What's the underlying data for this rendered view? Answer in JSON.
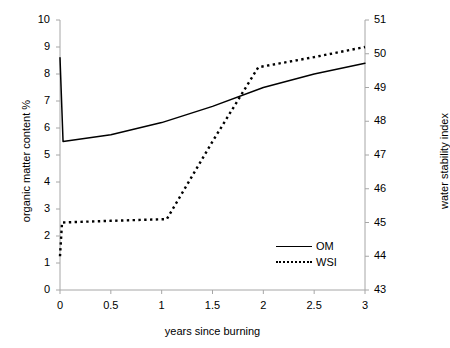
{
  "chart_data": {
    "type": "line",
    "title": "",
    "xlabel": "years since burning",
    "ylabel": "organic matter content  %",
    "y2label": "water stability index",
    "xlim": [
      0,
      3
    ],
    "ylim": [
      0,
      10
    ],
    "y2lim": [
      43,
      51
    ],
    "grid": false,
    "legend_position": "inside-bottom-right",
    "xticks": [
      "0",
      "0.5",
      "1",
      "1.5",
      "2",
      "2.5",
      "3"
    ],
    "xtick_values": [
      0,
      0.5,
      1,
      1.5,
      2,
      2.5,
      3
    ],
    "yticks": [
      "0",
      "1",
      "2",
      "3",
      "4",
      "5",
      "6",
      "7",
      "8",
      "9",
      "10"
    ],
    "ytick_values": [
      0,
      1,
      2,
      3,
      4,
      5,
      6,
      7,
      8,
      9,
      10
    ],
    "y2ticks": [
      "43",
      "44",
      "45",
      "46",
      "47",
      "48",
      "49",
      "50",
      "51"
    ],
    "y2tick_values": [
      43,
      44,
      45,
      46,
      47,
      48,
      49,
      50,
      51
    ],
    "series": [
      {
        "name": "OM",
        "axis": "left",
        "style": "solid",
        "color": "#000000",
        "x": [
          0.0,
          0.03,
          0.5,
          1.0,
          1.5,
          2.0,
          2.5,
          3.0
        ],
        "values": [
          8.6,
          5.5,
          5.75,
          6.2,
          6.8,
          7.5,
          8.0,
          8.4
        ]
      },
      {
        "name": "WSI",
        "axis": "right",
        "style": "dotted",
        "color": "#000000",
        "x": [
          0.0,
          0.02,
          0.5,
          1.05,
          1.5,
          1.95,
          2.5,
          3.0
        ],
        "values": [
          44.0,
          45.0,
          45.05,
          45.1,
          47.4,
          49.6,
          49.9,
          50.2
        ]
      }
    ]
  },
  "legend": {
    "items": [
      {
        "label": "OM",
        "style": "solid"
      },
      {
        "label": "WSI",
        "style": "dotted"
      }
    ]
  }
}
